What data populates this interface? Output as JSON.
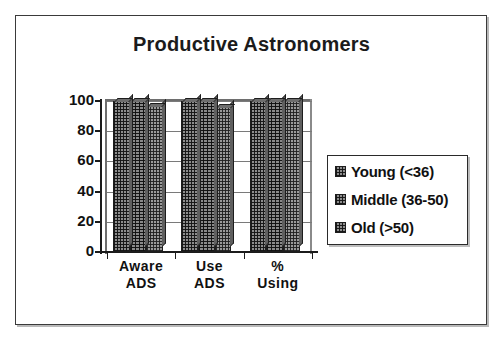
{
  "figure": {
    "title": "Productive Astronomers",
    "frame_color": "#3a3a3a",
    "background": "#ffffff",
    "text_color": "#111111"
  },
  "legend": {
    "position": "right",
    "entries": [
      {
        "label": "Young (<36)",
        "swatch": "pattern-swatch-young"
      },
      {
        "label": "Middle (36-50)",
        "swatch": "pattern-swatch-middle"
      },
      {
        "label": "Old (>50)",
        "swatch": "pattern-swatch-old"
      }
    ]
  },
  "axes": {
    "y_ticks": [
      "0",
      "20",
      "40",
      "60",
      "80",
      "100"
    ],
    "x_categories": [
      {
        "line1": "Aware",
        "line2": "ADS"
      },
      {
        "line1": "Use",
        "line2": "ADS"
      },
      {
        "line1": "%",
        "line2": "Using"
      }
    ]
  },
  "chart_data": {
    "type": "bar",
    "title": "Productive Astronomers",
    "xlabel": "",
    "ylabel": "",
    "ylim": [
      0,
      100
    ],
    "yticks": [
      0,
      20,
      40,
      60,
      80,
      100
    ],
    "grid": true,
    "legend_position": "right",
    "style": "3d-clustered-bar",
    "categories": [
      "Aware ADS",
      "Use ADS",
      "% Using"
    ],
    "series": [
      {
        "name": "Young (<36)",
        "values": [
          100,
          100,
          100
        ]
      },
      {
        "name": "Middle (36-50)",
        "values": [
          100,
          100,
          100
        ]
      },
      {
        "name": "Old (>50)",
        "values": [
          97,
          96,
          100
        ]
      }
    ]
  }
}
